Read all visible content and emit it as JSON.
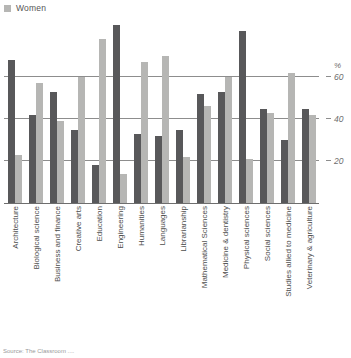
{
  "legend": {
    "items": [
      {
        "label": "Women",
        "color": "#b6b6b4"
      }
    ]
  },
  "axis": {
    "unit_label": "%",
    "y_ticks": [
      "60",
      "40",
      "20"
    ],
    "y_tick_values": [
      60,
      40,
      20
    ]
  },
  "footer": {
    "text": "Source: The Classroom   ...."
  },
  "colors": {
    "men": "#58585a",
    "women": "#b6b6b4",
    "gridline": "#8d8d8d",
    "axis": "#6e6e6e",
    "text": "#4d4d4d"
  },
  "chart_data": {
    "type": "bar",
    "title": "",
    "subtitle": "",
    "xlabel": "",
    "ylabel": "%",
    "ylim": [
      0,
      90
    ],
    "grid": true,
    "legend_position": "top-left",
    "categories": [
      "Architecture",
      "Biological science",
      "Business and finance",
      "Creative arts",
      "Education",
      "Engineering",
      "Humanities",
      "Languages",
      "Librarianship",
      "Mathematical Sciences",
      "Medicine & dentistry",
      "Physical sciences",
      "Social sciences",
      "Studies allied to medicine",
      "Veterinary & agriculture"
    ],
    "series": [
      {
        "name": "Men",
        "color": "#58585a",
        "values": [
          68,
          42,
          53,
          35,
          18,
          85,
          33,
          32,
          35,
          52,
          53,
          82,
          45,
          30,
          45
        ]
      },
      {
        "name": "Women",
        "color": "#b6b6b4",
        "values": [
          23,
          57,
          39,
          60,
          78,
          14,
          67,
          70,
          22,
          46,
          60,
          21,
          43,
          62,
          42
        ]
      }
    ]
  }
}
